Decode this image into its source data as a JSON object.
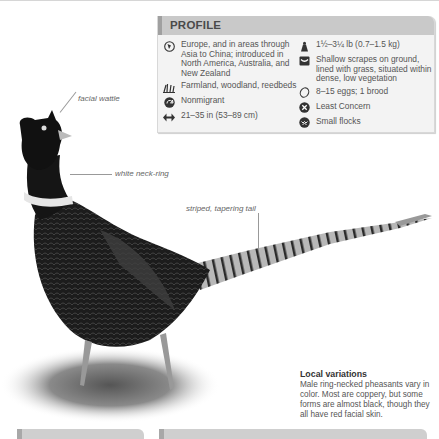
{
  "profile": {
    "title": "PROFILE",
    "left_items": [
      {
        "icon": "globe-icon",
        "text": "Europe, and in areas through Asia to China; introduced in North America, Australia, and New Zealand"
      },
      {
        "icon": "grass-habitat-icon",
        "text": "Farmland, woodland, reedbeds"
      },
      {
        "icon": "migration-arrow-icon",
        "text": "Nonmigrant"
      },
      {
        "icon": "wingspan-arrows-icon",
        "text": "21–35 in (53–89 cm)"
      }
    ],
    "right_items": [
      {
        "icon": "weight-icon",
        "text": "1½–3¼ lb (0.7–1.5 kg)"
      },
      {
        "icon": "nest-icon",
        "text": "Shallow scrapes on ground, lined with grass, situated within dense, low vegetation"
      },
      {
        "icon": "egg-icon",
        "text": "8–15 eggs; 1 brood"
      },
      {
        "icon": "conservation-status-icon",
        "text": "Least Concern"
      },
      {
        "icon": "flock-icon",
        "text": "Small flocks"
      }
    ]
  },
  "annotations": {
    "facial_wattle": "facial wattle",
    "neck_ring": "white neck-ring",
    "tail": "striped, tapering tail"
  },
  "caption": {
    "heading": "Local variations",
    "body": "Male ring-necked pheasants vary in color. Most are coppery, but some forms are almost black, though they all have red facial skin."
  }
}
